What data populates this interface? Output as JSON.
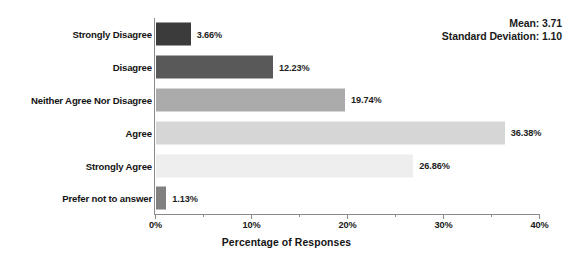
{
  "stats": {
    "mean_line": "Mean: 3.71",
    "sd_line": "Standard Deviation: 1.10"
  },
  "chart_data": {
    "type": "bar",
    "orientation": "horizontal",
    "title": "",
    "xlabel": "Percentage of Responses",
    "ylabel": "",
    "xlim": [
      0,
      40
    ],
    "xticks": [
      "0%",
      "10%",
      "20%",
      "30%",
      "40%"
    ],
    "xtick_values": [
      0,
      10,
      20,
      30,
      40
    ],
    "minor_tick_values": [
      5,
      15,
      25,
      35
    ],
    "grid": false,
    "legend": "none",
    "categories": [
      "Strongly Disagree",
      "Disagree",
      "Neither Agree Nor Disagree",
      "Agree",
      "Strongly Agree",
      "Prefer not to answer"
    ],
    "values": [
      3.66,
      12.23,
      19.74,
      36.38,
      26.86,
      1.13
    ],
    "value_labels": [
      "3.66%",
      "12.23%",
      "19.74%",
      "36.38%",
      "26.86%",
      "1.13%"
    ],
    "bar_colors": [
      "#3b3b3b",
      "#595959",
      "#ababab",
      "#d6d6d6",
      "#eeeeee",
      "#808080"
    ],
    "annotations": [
      "Mean: 3.71",
      "Standard Deviation: 1.10"
    ]
  },
  "axis": {
    "axis_color": "#8a8a8a"
  }
}
